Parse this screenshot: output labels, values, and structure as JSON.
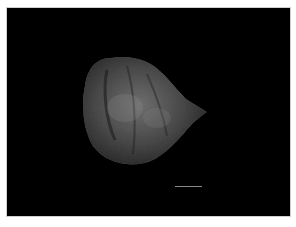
{
  "image": {
    "description": "Micrograph of a dark, rounded seed/specimen with a pointed right tip on black background",
    "background_color": "#000000",
    "border_color": "#ffffff",
    "specimen_colors": {
      "base": "#3a3a3a",
      "highlight": "#8c8c8c",
      "shadow": "#1a1a1a"
    },
    "scale_bar": {
      "label": "",
      "color": "#8a8a8a"
    }
  }
}
